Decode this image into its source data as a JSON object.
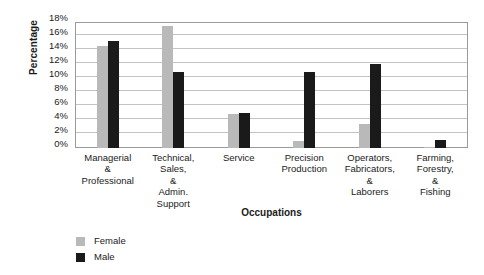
{
  "chart_data": {
    "type": "bar",
    "title": "",
    "xlabel": "Occupations",
    "ylabel": "Percentage",
    "categories": [
      "Managerial\n&\nProfessional",
      "Technical,\nSales,\n&\nAdmin.\nSupport",
      "Service",
      "Precision\nProduction",
      "Operators,\nFabricators,\n&\nLaborers",
      "Farming,\nForestry,\n&\nFishing"
    ],
    "series": [
      {
        "name": "Female",
        "color": "#b9b9b9",
        "values": [
          14.6,
          17.5,
          4.9,
          1.0,
          3.5,
          0.2
        ]
      },
      {
        "name": "Male",
        "color": "#1a1a1a",
        "values": [
          15.3,
          10.9,
          5.0,
          10.9,
          12.0,
          1.1
        ]
      }
    ],
    "ylim": [
      0,
      18
    ],
    "y_ticks": [
      "0%",
      "2%",
      "4%",
      "6%",
      "8%",
      "10%",
      "12%",
      "14%",
      "16%",
      "18%"
    ],
    "y_tick_values": [
      0,
      2,
      4,
      6,
      8,
      10,
      12,
      14,
      16,
      18
    ],
    "grid": true,
    "legend_position": "bottom-left"
  },
  "legend": {
    "entries": [
      {
        "label": "Female",
        "color": "#b9b9b9"
      },
      {
        "label": "Male",
        "color": "#1a1a1a"
      }
    ]
  },
  "colors": {
    "female": "#b9b9b9",
    "male": "#1a1a1a",
    "gridline": "#c3c3c3",
    "frame": "#9a9a9a",
    "text": "#1b1b1b",
    "background": "#ffffff"
  }
}
